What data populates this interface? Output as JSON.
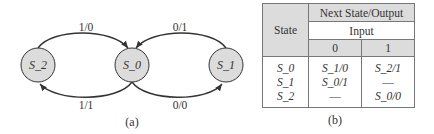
{
  "diagram_a": {
    "caption": "(a)",
    "nodes": [
      {
        "id": "S_2",
        "label": "S_2",
        "cx": 38,
        "cy": 65
      },
      {
        "id": "S_0",
        "label": "S_0",
        "cx": 132,
        "cy": 65
      },
      {
        "id": "S_1",
        "label": "S_1",
        "cx": 226,
        "cy": 65
      }
    ],
    "edges": [
      {
        "from": "S_2",
        "to": "S_0",
        "label": "1/0"
      },
      {
        "from": "S_1",
        "to": "S_0",
        "label": "0/1"
      },
      {
        "from": "S_0",
        "to": "S_2",
        "label": "1/1"
      },
      {
        "from": "S_0",
        "to": "S_1",
        "label": "0/0"
      }
    ],
    "colors": {
      "node_fill": "#dcdcdc",
      "stroke": "#333333"
    }
  },
  "table_b": {
    "caption": "(b)",
    "header_state": "State",
    "header_group": "Next State/Output",
    "header_input": "Input",
    "input_cols": [
      "0",
      "1"
    ],
    "rows": [
      {
        "state": "S_0",
        "in0": "S_1/0",
        "in1": "S_2/1"
      },
      {
        "state": "S_1",
        "in0": "S_0/1",
        "in1": "—"
      },
      {
        "state": "S_2",
        "in0": "—",
        "in1": "S_0/0"
      }
    ],
    "colors": {
      "header_fill": "#dcdcdc",
      "border": "#777777"
    }
  }
}
